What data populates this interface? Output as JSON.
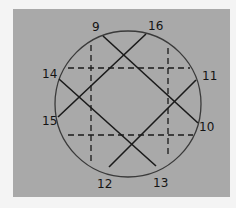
{
  "diagram": {
    "labels": [
      "9",
      "16",
      "11",
      "10",
      "13",
      "12",
      "15",
      "14"
    ],
    "solid_chords": [
      [
        "9",
        "10"
      ],
      [
        "16",
        "15"
      ],
      [
        "14",
        "13"
      ],
      [
        "11",
        "12"
      ]
    ],
    "dashed_lines": [
      "horizontal-upper",
      "horizontal-lower",
      "vertical-left",
      "vertical-right"
    ],
    "colors": {
      "background": "#a9a9a9",
      "ink": "#1a1a1a",
      "page": "#f4f4f4"
    }
  }
}
